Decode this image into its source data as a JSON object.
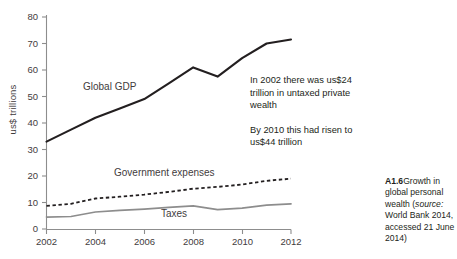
{
  "chart_data": {
    "type": "line",
    "title": "",
    "xlabel": "",
    "ylabel": "us$ trillions",
    "x": [
      2002,
      2003,
      2004,
      2005,
      2006,
      2007,
      2008,
      2009,
      2010,
      2011,
      2012
    ],
    "xlim": [
      2002,
      2012
    ],
    "ylim": [
      0,
      80
    ],
    "xticks": [
      "2002",
      "2004",
      "2006",
      "2008",
      "2010",
      "2012"
    ],
    "yticks": [
      "0",
      "10",
      "20",
      "30",
      "40",
      "50",
      "60",
      "70",
      "80"
    ],
    "grid": false,
    "legend": "inline-labels",
    "series": [
      {
        "name": "Global GDP",
        "style": "solid",
        "color": "#231f20",
        "values": [
          33,
          37.5,
          42,
          45.5,
          49,
          55,
          61,
          57.5,
          64.5,
          70,
          71.5
        ]
      },
      {
        "name": "Government expenses",
        "style": "dashed",
        "color": "#231f20",
        "values": [
          8.7,
          9.5,
          11.5,
          12.2,
          13,
          14,
          15.2,
          15.9,
          16.8,
          18.2,
          19
        ]
      },
      {
        "name": "Taxes",
        "style": "solid",
        "color": "#8d8d8d",
        "values": [
          4.5,
          4.7,
          6.4,
          7,
          7.5,
          8.2,
          8.7,
          7.3,
          7.9,
          9,
          9.5
        ]
      }
    ],
    "annotations": [
      "In 2002 there was us$24 trillion in untaxed private wealth",
      "By 2010 this had risen to us$44 trillion"
    ]
  },
  "annotation": {
    "paragraph_1": "In 2002 there was us$24 trillion in untaxed private wealth",
    "paragraph_2": "By 2010 this had risen to us$44 trillion"
  },
  "caption": {
    "figure_number": "A1.6",
    "text_before_source": "Growth in global personal wealth (",
    "source_label": "source:",
    "text_after_source": " World Bank 2014, accessed 21 June 2014)"
  },
  "series_labels": {
    "global_gdp": "Global GDP",
    "government_expenses": "Government expenses",
    "taxes": "Taxes"
  },
  "axes": {
    "y_title": "us$ trillions",
    "y_ticks": [
      "80",
      "70",
      "60",
      "50",
      "40",
      "30",
      "20",
      "10",
      "0"
    ],
    "x_ticks": [
      "2002",
      "2004",
      "2006",
      "2008",
      "2010",
      "2012"
    ]
  },
  "colors": {
    "gdp_line": "#231f20",
    "expenses_line": "#231f20",
    "taxes_line": "#8d8d8d",
    "axis": "#8d8d8d",
    "text": "#231f20"
  }
}
